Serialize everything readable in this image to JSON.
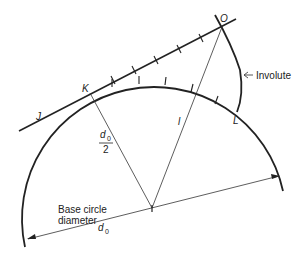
{
  "diagram": {
    "points": {
      "K": "K",
      "O": "O",
      "L": "L",
      "J": "J",
      "l": "l"
    },
    "labels": {
      "involute": "Involute",
      "radius_num": "d",
      "radius_sub": "0",
      "radius_den": "2",
      "base_line1": "Base circle",
      "base_line2": "diameter",
      "diameter_sym": "d",
      "diameter_sub": "0"
    },
    "colors": {
      "line": "#222222",
      "background": "#ffffff"
    }
  }
}
